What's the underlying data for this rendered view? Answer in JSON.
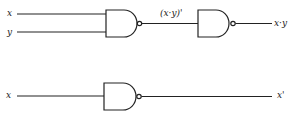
{
  "diagram": {
    "top_circuit": {
      "inputs": [
        "x",
        "y"
      ],
      "intermediate_label": "(x·y)'",
      "output_label": "x·y"
    },
    "bottom_circuit": {
      "input": "x",
      "output_label": "x'"
    },
    "colors": {
      "line": "#222222",
      "background": "#ffffff"
    }
  }
}
